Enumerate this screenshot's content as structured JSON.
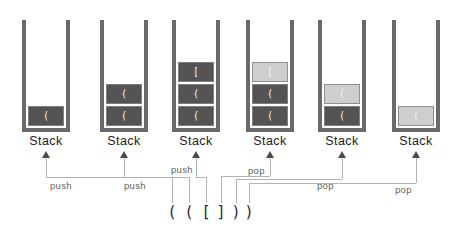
{
  "stacks": [
    {
      "label": "Stack",
      "items": [
        {
          "char": "(",
          "state": "normal"
        }
      ]
    },
    {
      "label": "Stack",
      "items": [
        {
          "char": "(",
          "state": "normal"
        },
        {
          "char": "(",
          "state": "normal"
        }
      ]
    },
    {
      "label": "Stack",
      "items": [
        {
          "char": "(",
          "state": "normal"
        },
        {
          "char": "(",
          "state": "normal"
        },
        {
          "char": "[",
          "state": "normal"
        }
      ]
    },
    {
      "label": "Stack",
      "items": [
        {
          "char": "(",
          "state": "normal"
        },
        {
          "char": "(",
          "state": "normal"
        },
        {
          "char": "[",
          "state": "highlighted"
        }
      ]
    },
    {
      "label": "Stack",
      "items": [
        {
          "char": "(",
          "state": "normal"
        },
        {
          "char": "(",
          "state": "highlighted"
        }
      ]
    },
    {
      "label": "Stack",
      "items": [
        {
          "char": "(",
          "state": "highlighted"
        }
      ]
    }
  ],
  "operations": [
    {
      "label": "push"
    },
    {
      "label": "push"
    },
    {
      "label": "push"
    },
    {
      "label": "pop"
    },
    {
      "label": "pop"
    },
    {
      "label": "pop"
    }
  ],
  "sequence": [
    "(",
    "(",
    "[",
    "]",
    ")",
    ")"
  ],
  "colors": {
    "background": "#ffffff",
    "wall": "#6a6a6a",
    "block_dark": "#545454",
    "block_dark_border": "#7e7e7e",
    "block_light": "#cecece",
    "block_light_border": "#8f8f8f",
    "block_text": "#f2f2f2",
    "stack_label_text": "#1c1c1c",
    "op_label_text": "#5f5f5f",
    "connector_line": "#b3b3b3",
    "arrowhead": "#4a4a4a",
    "sequence_text": "#2a2a2a"
  }
}
